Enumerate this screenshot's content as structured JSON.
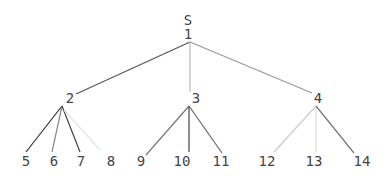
{
  "tree": {
    "root_label": "S",
    "nodes": [
      {
        "id": "1",
        "label": "1",
        "x": 188,
        "y": 34
      },
      {
        "id": "2",
        "label": "2",
        "x": 70,
        "y": 98
      },
      {
        "id": "3",
        "label": "3",
        "x": 196,
        "y": 98
      },
      {
        "id": "4",
        "label": "4",
        "x": 318,
        "y": 98
      },
      {
        "id": "5",
        "label": "5",
        "x": 26,
        "y": 161
      },
      {
        "id": "6",
        "label": "6",
        "x": 54,
        "y": 161
      },
      {
        "id": "7",
        "label": "7",
        "x": 81,
        "y": 161
      },
      {
        "id": "8",
        "label": "8",
        "x": 111,
        "y": 161
      },
      {
        "id": "9",
        "label": "9",
        "x": 141,
        "y": 161
      },
      {
        "id": "10",
        "label": "10",
        "x": 182,
        "y": 161
      },
      {
        "id": "11",
        "label": "11",
        "x": 221,
        "y": 161
      },
      {
        "id": "12",
        "label": "12",
        "x": 267,
        "y": 161
      },
      {
        "id": "13",
        "label": "13",
        "x": 314,
        "y": 161
      },
      {
        "id": "14",
        "label": "14",
        "x": 362,
        "y": 161
      }
    ],
    "edges": [
      {
        "from": [
          190,
          42
        ],
        "to": [
          76,
          94
        ],
        "color": "#555"
      },
      {
        "from": [
          190,
          42
        ],
        "to": [
          190,
          92
        ],
        "color": "#bbb"
      },
      {
        "from": [
          190,
          42
        ],
        "to": [
          312,
          93
        ],
        "color": "#999"
      },
      {
        "from": [
          62,
          106
        ],
        "to": [
          26,
          152
        ],
        "color": "#333"
      },
      {
        "from": [
          62,
          106
        ],
        "to": [
          52,
          152
        ],
        "color": "#888"
      },
      {
        "from": [
          62,
          106
        ],
        "to": [
          80,
          152
        ],
        "color": "#444"
      },
      {
        "from": [
          64,
          110
        ],
        "to": [
          100,
          150
        ],
        "color": "#e4e4e4"
      },
      {
        "from": [
          189,
          106
        ],
        "to": [
          146,
          155
        ],
        "color": "#777"
      },
      {
        "from": [
          189,
          106
        ],
        "to": [
          189,
          152
        ],
        "color": "#444"
      },
      {
        "from": [
          189,
          106
        ],
        "to": [
          222,
          153
        ],
        "color": "#666"
      },
      {
        "from": [
          316,
          106
        ],
        "to": [
          274,
          152
        ],
        "color": "#ccc"
      },
      {
        "from": [
          316,
          106
        ],
        "to": [
          316,
          152
        ],
        "color": "#ddd"
      },
      {
        "from": [
          316,
          106
        ],
        "to": [
          354,
          153
        ],
        "color": "#777"
      }
    ]
  }
}
